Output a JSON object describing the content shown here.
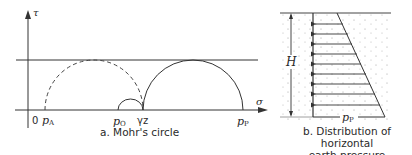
{
  "figure": {
    "panel_a": {
      "caption": "a.  Mohr's circle",
      "axes": {
        "y_label": "τ",
        "x_label": "σ",
        "origin_label": "0"
      },
      "points": {
        "p_a": {
          "main": "p",
          "sub": "A"
        },
        "p_o": {
          "main": "p",
          "sub": "O"
        },
        "gamma_z": "γz",
        "p_p": {
          "main": "p",
          "sub": "P"
        }
      },
      "circles": [
        {
          "name": "active-circle",
          "style": "dashed",
          "from": "p_A",
          "to": "γz"
        },
        {
          "name": "at-rest-circle",
          "style": "solid",
          "from": "p_O",
          "to": "γz"
        },
        {
          "name": "passive-circle",
          "style": "solid",
          "from": "γz",
          "to": "p_P"
        }
      ],
      "envelope": "horizontal failure line tangent to active and passive circles"
    },
    "panel_b": {
      "caption_line1": "b.  Distribution of horizontal",
      "caption_line2": "earth pressure",
      "height_label": "H",
      "base_pressure": {
        "main": "p",
        "sub": "P"
      },
      "arrow_count": 9
    }
  }
}
